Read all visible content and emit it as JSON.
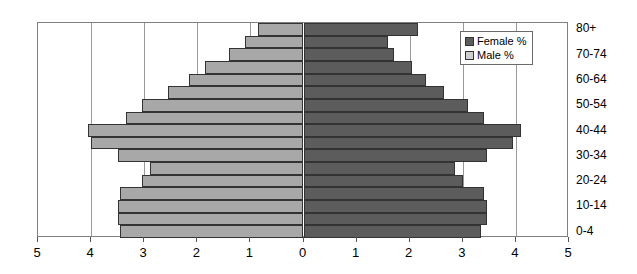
{
  "chart_data": {
    "type": "bar",
    "subtype": "population-pyramid",
    "title": "",
    "xlabel": "",
    "ylabel": "",
    "orientation": "horizontal-diverging",
    "categories": [
      "0-4",
      "5-9",
      "10-14",
      "15-19",
      "20-24",
      "25-29",
      "30-34",
      "35-39",
      "40-44",
      "45-49",
      "50-54",
      "55-59",
      "60-64",
      "65-69",
      "70-74",
      "75-79",
      "80+"
    ],
    "category_labels_shown": [
      "0-4",
      "10-14",
      "20-24",
      "30-34",
      "40-44",
      "50-54",
      "60-64",
      "70-74",
      "80+"
    ],
    "series": [
      {
        "name": "Male %",
        "side": "left",
        "color": "#a8a8a8",
        "values": [
          3.45,
          3.5,
          3.5,
          3.45,
          3.05,
          2.9,
          3.5,
          4.0,
          4.05,
          3.35,
          3.05,
          2.55,
          2.15,
          1.85,
          1.4,
          1.1,
          0.85
        ]
      },
      {
        "name": "Female %",
        "side": "right",
        "color": "#5c5c5c",
        "values": [
          3.35,
          3.45,
          3.45,
          3.4,
          3.0,
          2.85,
          3.45,
          3.95,
          4.1,
          3.4,
          3.1,
          2.65,
          2.3,
          2.05,
          1.7,
          1.6,
          2.15
        ]
      }
    ],
    "xticks_left": [
      "5",
      "4",
      "3",
      "2",
      "1",
      "0"
    ],
    "xticks_right": [
      "0",
      "1",
      "2",
      "3",
      "4",
      "5"
    ],
    "xticks": [
      "5",
      "4",
      "3",
      "2",
      "1",
      "0",
      "1",
      "2",
      "3",
      "4",
      "5"
    ],
    "xlim": [
      -5,
      5
    ],
    "xtick_step": 1,
    "grid": true,
    "legend_position": "top-right"
  },
  "legend": {
    "items": [
      {
        "label": "Female %",
        "swatch": "female-swatch"
      },
      {
        "label": "Male %",
        "swatch": "male-swatch"
      }
    ]
  }
}
